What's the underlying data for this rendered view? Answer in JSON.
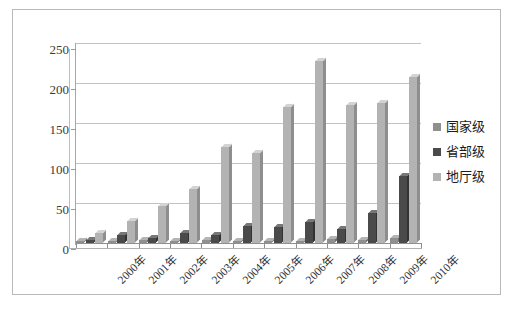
{
  "figure": {
    "caption": ""
  },
  "legend": {
    "position": "right",
    "items": [
      {
        "label": "国家级",
        "color": "#8f8f8f",
        "swatch_name": "legend-swatch-national"
      },
      {
        "label": "省部级",
        "color": "#4a4a4a",
        "swatch_name": "legend-swatch-provincial"
      },
      {
        "label": "地厅级",
        "color": "#b3b3b3",
        "swatch_name": "legend-swatch-prefectural"
      }
    ]
  },
  "axes": {
    "y_ticks": [
      "0",
      "50",
      "100",
      "150",
      "200",
      "250"
    ],
    "x_ticks": [
      "2000年",
      "2001年",
      "2002年",
      "2003年",
      "2004年",
      "2005年",
      "2006年",
      "2007年",
      "2008年",
      "2009年",
      "2010年"
    ]
  },
  "chart_data": {
    "type": "bar",
    "title": "",
    "subtitle": "",
    "xlabel": "",
    "ylabel": "",
    "ylim": [
      0,
      250
    ],
    "ytick_step": 50,
    "grid": true,
    "legend_position": "right",
    "style": "3d-clustered-column",
    "categories": [
      "2000年",
      "2001年",
      "2002年",
      "2003年",
      "2004年",
      "2005年",
      "2006年",
      "2007年",
      "2008年",
      "2009年",
      "2010年"
    ],
    "series": [
      {
        "name": "国家级",
        "color": "#8f8f8f",
        "values": [
          3,
          2,
          4,
          3,
          4,
          3,
          2,
          3,
          5,
          4,
          6
        ]
      },
      {
        "name": "省部级",
        "color": "#4a4a4a",
        "values": [
          4,
          10,
          6,
          13,
          10,
          21,
          20,
          26,
          17,
          37,
          84
        ]
      },
      {
        "name": "地厅级",
        "color": "#b3b3b3",
        "values": [
          13,
          27,
          46,
          68,
          120,
          113,
          170,
          228,
          172,
          175,
          207
        ]
      }
    ],
    "annotations": []
  }
}
